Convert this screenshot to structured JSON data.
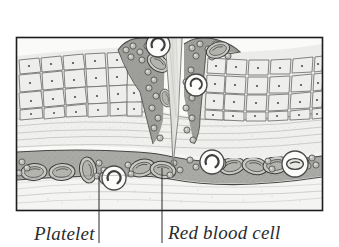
{
  "figure": {
    "frame": {
      "x": 16,
      "y": 37,
      "width": 307,
      "height": 174,
      "border_color": "#1a1a1a"
    },
    "background_color": "#ffffff",
    "line_color": "#4a4a4a"
  },
  "labels": [
    {
      "id": "platelet",
      "text": "Platelet",
      "x": 34,
      "y": 224,
      "leader_line": {
        "x": 99,
        "y_top": 176,
        "y_bottom": 243
      }
    },
    {
      "id": "red_blood_cell",
      "text": "Red blood cell",
      "x": 168,
      "y": 223,
      "leader_line": {
        "x": 162,
        "y_top": 168,
        "y_bottom": 243
      }
    }
  ],
  "layers": [
    {
      "name": "epidermis",
      "fill": "#e8e8e6",
      "stroke": "#585858",
      "description": "polygonal keratinocytes with nuclei"
    },
    {
      "name": "dermis",
      "fill": "#efefed",
      "stroke": "#8d8d8d",
      "description": "wavy collagen fibre bands"
    },
    {
      "name": "blood-vessel",
      "fill": "#a9a9a5",
      "stroke": "#4e4e4e",
      "description": "horizontal capillary lumen"
    },
    {
      "name": "wound-blood",
      "fill": "#9c9c98",
      "stroke": "#4e4e4e",
      "description": "blood pooling in puncture channel"
    },
    {
      "name": "subcutaneous",
      "fill": "#f2f2f0",
      "stroke": "#9a9a9a",
      "description": "lower connective tissue"
    }
  ],
  "instrument": {
    "name": "needle",
    "fill": "#dededa",
    "stroke": "#6a6a6a",
    "tip_x": 173,
    "tip_y": 165,
    "top_y": 0,
    "top_width": 22
  },
  "callouts": [
    {
      "id": "callout-platelet-upper",
      "type": "platelet",
      "cx": 158,
      "cy": 45,
      "r": 12
    },
    {
      "id": "callout-platelet-mid",
      "type": "platelet",
      "cx": 196,
      "cy": 85,
      "r": 11
    },
    {
      "id": "callout-platelet-lower-left",
      "type": "platelet",
      "cx": 114,
      "cy": 178,
      "r": 12
    },
    {
      "id": "callout-platelet-lower-right",
      "type": "platelet",
      "cx": 212,
      "cy": 162,
      "r": 12
    },
    {
      "id": "callout-rbc-vessel",
      "type": "red-blood-cell",
      "cx": 295,
      "cy": 164,
      "r": 13
    }
  ],
  "cell_counts": {
    "red_blood_cells_in_vessel": 11,
    "platelets_visible": 38,
    "epidermis_cells": 96
  },
  "colors": {
    "ink": "#2b2b2b",
    "mid_gray": "#8a8a8a",
    "light_gray": "#e9e9e7",
    "vessel_gray": "#a9a9a5"
  }
}
